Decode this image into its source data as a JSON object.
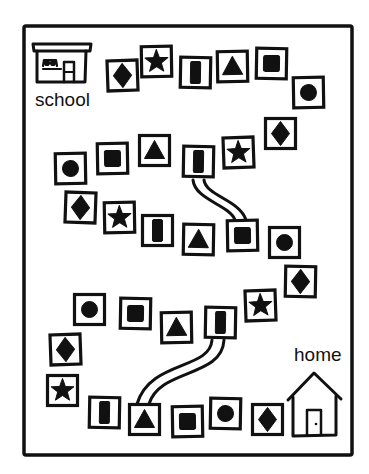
{
  "board": {
    "title_labels": {
      "start": "school",
      "end": "home"
    },
    "border": {
      "x": 24,
      "y": 26,
      "w": 328,
      "h": 429,
      "stroke": "#111111"
    },
    "colors": {
      "ink": "#111111",
      "paper": "#ffffff"
    },
    "tiles": [
      {
        "shape": "diamond",
        "x": 106,
        "y": 59,
        "r": -2
      },
      {
        "shape": "star",
        "x": 140,
        "y": 45,
        "r": -1
      },
      {
        "shape": "rect",
        "x": 179,
        "y": 56,
        "r": 1
      },
      {
        "shape": "triangle",
        "x": 216,
        "y": 50,
        "r": -1
      },
      {
        "shape": "square",
        "x": 255,
        "y": 47,
        "r": 1
      },
      {
        "shape": "circle",
        "x": 292,
        "y": 76,
        "r": -1
      },
      {
        "shape": "diamond",
        "x": 264,
        "y": 117,
        "r": 0
      },
      {
        "shape": "star",
        "x": 222,
        "y": 136,
        "r": -2
      },
      {
        "shape": "rect",
        "x": 182,
        "y": 145,
        "r": 1
      },
      {
        "shape": "triangle",
        "x": 138,
        "y": 134,
        "r": 0
      },
      {
        "shape": "square",
        "x": 96,
        "y": 142,
        "r": -1
      },
      {
        "shape": "circle",
        "x": 54,
        "y": 152,
        "r": -1
      },
      {
        "shape": "diamond",
        "x": 64,
        "y": 191,
        "r": 2
      },
      {
        "shape": "star",
        "x": 103,
        "y": 201,
        "r": -1
      },
      {
        "shape": "rect",
        "x": 141,
        "y": 214,
        "r": 0
      },
      {
        "shape": "triangle",
        "x": 182,
        "y": 223,
        "r": 1
      },
      {
        "shape": "square",
        "x": 226,
        "y": 219,
        "r": -1
      },
      {
        "shape": "circle",
        "x": 268,
        "y": 226,
        "r": 0
      },
      {
        "shape": "diamond",
        "x": 284,
        "y": 265,
        "r": 1
      },
      {
        "shape": "star",
        "x": 244,
        "y": 289,
        "r": -2
      },
      {
        "shape": "rect",
        "x": 204,
        "y": 306,
        "r": 1
      },
      {
        "shape": "triangle",
        "x": 160,
        "y": 311,
        "r": -1
      },
      {
        "shape": "square",
        "x": 119,
        "y": 297,
        "r": 1
      },
      {
        "shape": "circle",
        "x": 73,
        "y": 293,
        "r": 0
      },
      {
        "shape": "diamond",
        "x": 49,
        "y": 333,
        "r": -2
      },
      {
        "shape": "star",
        "x": 46,
        "y": 374,
        "r": 0
      },
      {
        "shape": "rect",
        "x": 88,
        "y": 396,
        "r": 1
      },
      {
        "shape": "triangle",
        "x": 128,
        "y": 403,
        "r": 0
      },
      {
        "shape": "square",
        "x": 171,
        "y": 405,
        "r": -1
      },
      {
        "shape": "circle",
        "x": 209,
        "y": 397,
        "r": 1
      },
      {
        "shape": "diamond",
        "x": 251,
        "y": 403,
        "r": 0
      }
    ],
    "shortcuts": [
      {
        "from_tile": 8,
        "to_tile": 16,
        "path": "M193 180 C 195 200, 230 205, 235 220",
        "path2": "M204 180 C 206 196, 240 200, 246 220"
      },
      {
        "from_tile": 20,
        "to_tile": 27,
        "path": "M212 340 C 210 370, 150 360, 137 404",
        "path2": "M224 340 C 222 378, 160 368, 149 404"
      }
    ]
  }
}
